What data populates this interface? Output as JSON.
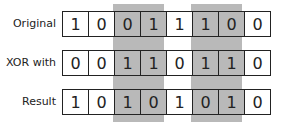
{
  "rows": [
    {
      "label": "Original",
      "bits": [
        "1",
        "0",
        "0",
        "1",
        "1",
        "1",
        "0",
        "0"
      ]
    },
    {
      "label": "XOR with",
      "bits": [
        "0",
        "0",
        "1",
        "1",
        "0",
        "1",
        "1",
        "0"
      ]
    },
    {
      "label": "Result",
      "bits": [
        "1",
        "0",
        "1",
        "0",
        "1",
        "0",
        "1",
        "0"
      ]
    }
  ],
  "shaded_columns": [
    2,
    3,
    5,
    6
  ],
  "colors": {
    "shade": "#b9b9b9",
    "border": "#222222",
    "background": "#ffffff"
  }
}
